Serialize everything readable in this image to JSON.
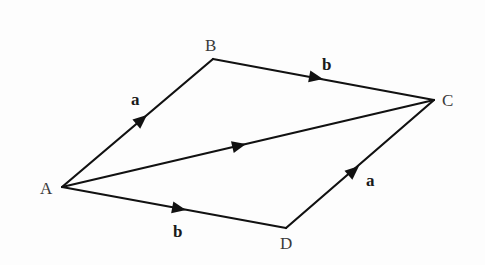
{
  "diagram": {
    "type": "parallelogram-vector-addition",
    "colors": {
      "line": "#111111",
      "vertex_label": "#3a3a3a",
      "vector_label": "#1a1a1a",
      "background": "#fdfdfd"
    },
    "vertices": {
      "A": {
        "label": "A",
        "x": 62,
        "y": 187
      },
      "B": {
        "label": "B",
        "x": 213,
        "y": 59
      },
      "C": {
        "label": "C",
        "x": 434,
        "y": 100
      },
      "D": {
        "label": "D",
        "x": 286,
        "y": 228
      }
    },
    "edges": [
      {
        "from": "A",
        "to": "B",
        "vector": "a"
      },
      {
        "from": "B",
        "to": "C",
        "vector": "b"
      },
      {
        "from": "A",
        "to": "C",
        "vector": ""
      },
      {
        "from": "A",
        "to": "D",
        "vector": "b"
      },
      {
        "from": "D",
        "to": "C",
        "vector": "a"
      }
    ],
    "labels": {
      "A": "A",
      "B": "B",
      "C": "C",
      "D": "D",
      "ab_vector": "a",
      "bc_vector": "b",
      "ad_vector": "b",
      "dc_vector": "a"
    }
  }
}
